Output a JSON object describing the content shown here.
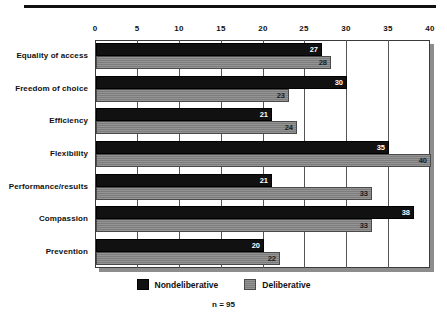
{
  "chart_data": {
    "type": "bar",
    "orientation": "horizontal",
    "title": "",
    "subtitle": "",
    "xlabel": "",
    "ylabel": "",
    "xlim": [
      0,
      40
    ],
    "xticks": [
      0,
      5,
      10,
      15,
      20,
      25,
      30,
      35,
      40
    ],
    "grid": true,
    "grid_axis": "x",
    "legend_position": "bottom",
    "footnote": "n = 95",
    "categories": [
      "Equality of access",
      "Freedom of choice",
      "Efficiency",
      "Flexibility",
      "Performance/results",
      "Compassion",
      "Prevention"
    ],
    "series": [
      {
        "name": "Nondeliberative",
        "color": "#111111",
        "values": [
          27,
          30,
          21,
          35,
          21,
          38,
          20
        ]
      },
      {
        "name": "Deliberative",
        "color": "#7d7d7d",
        "values": [
          28,
          23,
          24,
          40,
          33,
          33,
          22
        ]
      }
    ]
  },
  "colors": {
    "nondeliberative": "#111111",
    "deliberative": "#7d7d7d",
    "frame": "#3a3a3a",
    "shadow": "#8d8d8d",
    "rule": "#111111",
    "text": "#111111"
  }
}
